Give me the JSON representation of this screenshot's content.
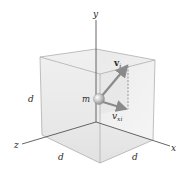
{
  "diagram": {
    "axes": {
      "x_label": "x",
      "y_label": "y",
      "z_label": "z"
    },
    "dimensions": {
      "height_label": "d",
      "depth_label": "d",
      "width_label": "d"
    },
    "particle": {
      "label": "m"
    },
    "vectors": {
      "velocity_main": "v",
      "velocity_main_sub": "i",
      "velocity_x": "v",
      "velocity_x_sub": "xi"
    },
    "colors": {
      "box_fill_light": "#f2f2f2",
      "box_fill_shade": "#dcdcdc",
      "box_edge": "#a8a8a8",
      "axis": "#555555",
      "vector": "#8a8a8a",
      "sphere": "#b8b8b8"
    }
  }
}
